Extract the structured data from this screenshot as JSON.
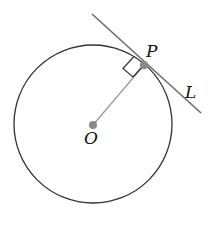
{
  "diagram": {
    "labels": {
      "center": "O",
      "tangent_point": "P",
      "tangent_line": "L"
    },
    "colors": {
      "circle": "#333333",
      "tangent_line": "#6b6b6b",
      "radius": "#9a9a9a",
      "points": "#8a8a8a",
      "right_angle_mark": "#333333",
      "text": "#111111"
    },
    "annotations": [
      "right-angle marker between radius OP and line L"
    ]
  }
}
